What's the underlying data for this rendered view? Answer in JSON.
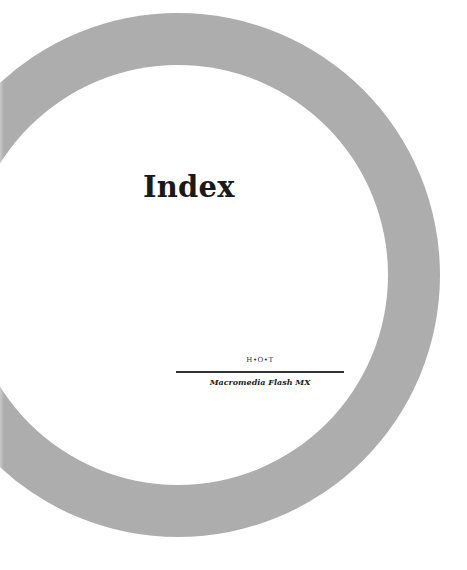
{
  "page": {
    "title": "Index",
    "series_mark": "H•O•T",
    "book_title": "Macromedia Flash MX"
  },
  "colors": {
    "ring": "#adadad",
    "background": "#ffffff",
    "text": "#1a1a1a"
  }
}
